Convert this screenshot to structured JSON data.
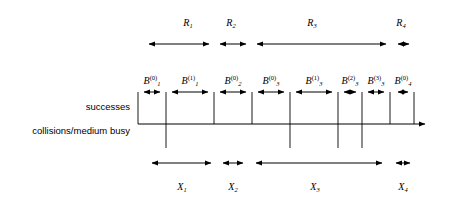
{
  "diagram": {
    "axis": {
      "name": "time-axis",
      "x_start": 138,
      "x_end": 432,
      "y": 124,
      "arrow": "right-arrow"
    },
    "side_labels": [
      {
        "id": "successes",
        "text": "successes",
        "x": 130,
        "y": 107
      },
      {
        "id": "collisions",
        "text": "collisions/medium busy",
        "x": 130,
        "y": 131
      }
    ],
    "success_ticks": [
      {
        "x": 138
      },
      {
        "x": 166
      },
      {
        "x": 214
      },
      {
        "x": 252
      },
      {
        "x": 290
      },
      {
        "x": 338
      },
      {
        "x": 362
      },
      {
        "x": 390
      },
      {
        "x": 414
      }
    ],
    "collision_ticks": [
      {
        "x": 166
      },
      {
        "x": 290
      },
      {
        "x": 338
      },
      {
        "x": 362
      }
    ],
    "r_row": {
      "y_arrow": 44,
      "y_label": 18,
      "segments": [
        {
          "id": "R1",
          "label": "R",
          "sub": "1",
          "x1": 145,
          "x2": 213,
          "label_x": 188
        },
        {
          "id": "R2",
          "label": "R",
          "sub": "2",
          "x1": 216,
          "x2": 250,
          "label_x": 231
        },
        {
          "id": "R3",
          "label": "R",
          "sub": "3",
          "x1": 253,
          "x2": 390,
          "label_x": 312
        },
        {
          "id": "R4",
          "label": "R",
          "sub": "4",
          "x1": 394,
          "x2": 413,
          "label_x": 401
        }
      ]
    },
    "b_row": {
      "y_arrow": 92,
      "y_label": 76,
      "segments": [
        {
          "id": "B1_0",
          "label": "B",
          "sub": "1",
          "sup": "(0)",
          "x1": 140,
          "x2": 164,
          "label_x": 152
        },
        {
          "id": "B1_1",
          "label": "B",
          "sub": "1",
          "sup": "(1)",
          "x1": 168,
          "x2": 212,
          "label_x": 190
        },
        {
          "id": "B2_0",
          "label": "B",
          "sub": "2",
          "sup": "(0)",
          "x1": 216,
          "x2": 250,
          "label_x": 233
        },
        {
          "id": "B3_0",
          "label": "B",
          "sub": "3",
          "sup": "(0)",
          "x1": 254,
          "x2": 288,
          "label_x": 271
        },
        {
          "id": "B3_1",
          "label": "B",
          "sub": "3",
          "sup": "(1)",
          "x1": 292,
          "x2": 336,
          "label_x": 314
        },
        {
          "id": "B3_2",
          "label": "B",
          "sub": "3",
          "sup": "(2)",
          "x1": 340,
          "x2": 360,
          "label_x": 350
        },
        {
          "id": "B3_3",
          "label": "B",
          "sub": "3",
          "sup": "(3)",
          "x1": 364,
          "x2": 388,
          "label_x": 376
        },
        {
          "id": "B4_0",
          "label": "B",
          "sub": "4",
          "sup": "(0)",
          "x1": 394,
          "x2": 412,
          "label_x": 403
        }
      ]
    },
    "x_row": {
      "y_arrow": 163,
      "y_label": 182,
      "segments": [
        {
          "id": "X1",
          "label": "X",
          "sub": "1",
          "x1": 148,
          "x2": 215,
          "label_x": 182
        },
        {
          "id": "X2",
          "label": "X",
          "sub": "2",
          "x1": 219,
          "x2": 247,
          "label_x": 233
        },
        {
          "id": "X3",
          "label": "X",
          "sub": "3",
          "x1": 252,
          "x2": 386,
          "label_x": 315
        },
        {
          "id": "X4",
          "label": "X",
          "sub": "4",
          "x1": 392,
          "x2": 414,
          "label_x": 403
        }
      ]
    },
    "colors": {
      "line": "#000000",
      "text": "#000000",
      "background": "#ffffff"
    },
    "geometry": {
      "tick_top": 92,
      "tick_bottom": 148,
      "axis_y": 124
    }
  }
}
